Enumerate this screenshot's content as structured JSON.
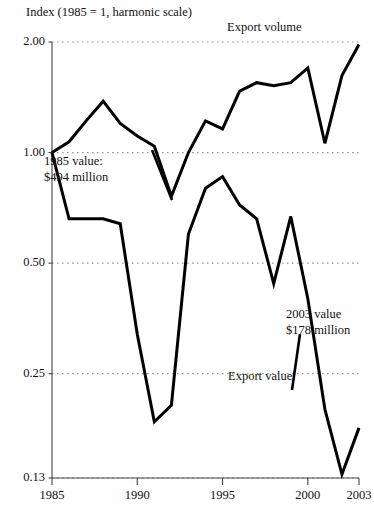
{
  "chart_data": {
    "type": "line",
    "title": "Index (1985 = 1, harmonic scale)",
    "xlabel": "",
    "ylabel": "Index (1985 = 1, harmonic scale)",
    "scale": "log",
    "grid": true,
    "legend_position": "inline-annotation",
    "xlim": [
      1985,
      2003
    ],
    "ylim": [
      0.13,
      2.0
    ],
    "x": [
      1985,
      1986,
      1987,
      1988,
      1989,
      1990,
      1991,
      1992,
      1993,
      1994,
      1995,
      1996,
      1997,
      1998,
      1999,
      2000,
      2001,
      2002,
      2003
    ],
    "ytick_labels": [
      "2.00",
      "1.00",
      "0.50",
      "0.25",
      "0.13"
    ],
    "ytick_values": [
      2.0,
      1.0,
      0.5,
      0.25,
      0.13
    ],
    "xtick_labels": [
      "1985",
      "1990",
      "1995",
      "2000",
      "2003"
    ],
    "xtick_values": [
      1985,
      1990,
      1995,
      2000,
      2003
    ],
    "series": [
      {
        "name": "Export volume",
        "values": [
          1.0,
          1.07,
          1.22,
          1.38,
          1.2,
          1.11,
          1.04,
          0.76,
          1.0,
          1.22,
          1.16,
          1.47,
          1.55,
          1.52,
          1.55,
          1.7,
          1.06,
          1.62,
          1.97
        ]
      },
      {
        "name": "Export value",
        "values": [
          1.0,
          0.66,
          0.66,
          0.66,
          0.64,
          0.32,
          0.185,
          0.205,
          0.6,
          0.8,
          0.86,
          0.72,
          0.66,
          0.44,
          0.67,
          0.4,
          0.2,
          0.133,
          0.178
        ]
      }
    ],
    "annotations": [
      {
        "name": "start-value-annotation",
        "line1": "1985 value:",
        "line2": "$494 million"
      },
      {
        "name": "end-value-annotation",
        "line1": "2003 value",
        "line2": "$178 million"
      },
      {
        "name": "volume-series-label",
        "text": "Export volume"
      },
      {
        "name": "value-series-label",
        "text": "Export value"
      }
    ],
    "colors": {
      "line": "#000000",
      "grid": "#9a9a9a",
      "axis": "#444444",
      "text": "#111111",
      "background": "#ffffff"
    }
  }
}
